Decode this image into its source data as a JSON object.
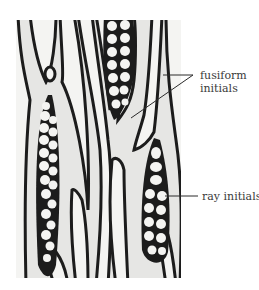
{
  "figure": {
    "image_description": "photomicrograph of vascular cambium, tangential section",
    "labels": [
      {
        "id": "fusiform",
        "line1": "fusiform",
        "line2": "initials"
      },
      {
        "id": "ray",
        "line1": "ray initials"
      }
    ],
    "colors": {
      "cell_wall": "#1c1c1c",
      "cell_lumen": "#f3f3f1",
      "background": "#e4e4e2",
      "label_text": "#3a3a3a"
    }
  }
}
